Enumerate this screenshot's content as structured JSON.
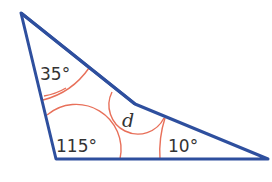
{
  "figure": {
    "type": "concave quadrilateral with angle arcs",
    "colors": {
      "outline": "#2e4f9e",
      "arc": "#e8705a",
      "text": "#333333"
    },
    "angles": [
      {
        "id": "top",
        "label": "35°"
      },
      {
        "id": "bottom-left",
        "label": "115°"
      },
      {
        "id": "bottom-right",
        "label": "10°"
      },
      {
        "id": "reflex",
        "label": "d"
      }
    ]
  }
}
